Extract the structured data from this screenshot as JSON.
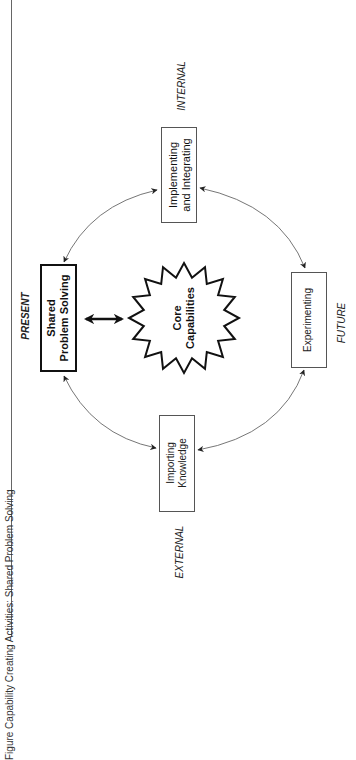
{
  "figure": {
    "title": "Figure   Capability Creating Activities: Shared Problem Solving"
  },
  "diagram": {
    "center": {
      "label_line1": "Core",
      "label_line2": "Capabilities",
      "shape": "starburst"
    },
    "nodes": [
      {
        "id": "shared",
        "line1": "Shared",
        "line2": "Problem Solving",
        "emphasis": "bold"
      },
      {
        "id": "implementing",
        "line1": "Implementing",
        "line2": "and Integrating",
        "emphasis": "normal"
      },
      {
        "id": "experimenting",
        "line1": "Experimenting",
        "line2": "",
        "emphasis": "normal"
      },
      {
        "id": "importing",
        "line1": "Importing",
        "line2": "Knowledge",
        "emphasis": "normal"
      }
    ],
    "orientation_labels": {
      "present": "PRESENT",
      "internal": "INTERNAL",
      "future": "FUTURE",
      "external": "EXTERNAL"
    },
    "edges": [
      {
        "from": "implementing",
        "to": "shared",
        "type": "bidirectional-arc"
      },
      {
        "from": "implementing",
        "to": "experimenting",
        "type": "bidirectional-arc"
      },
      {
        "from": "importing",
        "to": "shared",
        "type": "bidirectional-arc"
      },
      {
        "from": "importing",
        "to": "experimenting",
        "type": "bidirectional-arc"
      },
      {
        "from": "shared",
        "to": "center",
        "type": "bold-double-arrow"
      }
    ],
    "colors": {
      "line": "#555555",
      "bold": "#111111",
      "background": "#ffffff"
    }
  }
}
